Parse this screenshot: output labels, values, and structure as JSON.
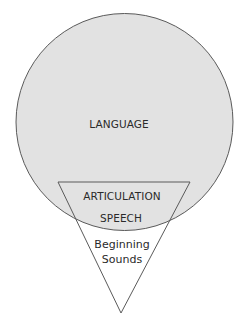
{
  "diagram": {
    "type": "venn-circle-triangle",
    "circle": {
      "label": "LANGUAGE",
      "fill": "#e2e2e2",
      "stroke": "#555555"
    },
    "triangle": {
      "overlap_labels": [
        "ARTICULATION",
        "SPEECH"
      ],
      "outside_labels": [
        "Beginning",
        "Sounds"
      ],
      "stroke": "#555555"
    }
  }
}
